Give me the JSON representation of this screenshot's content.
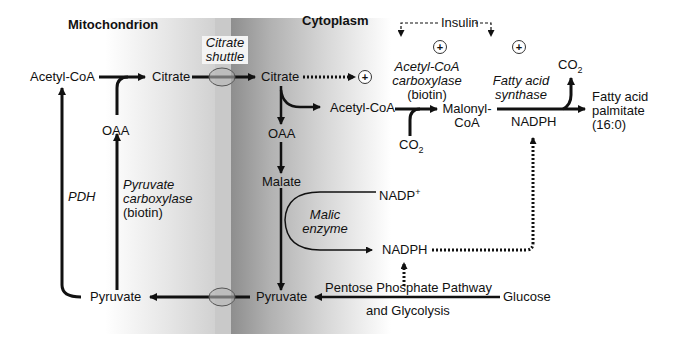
{
  "compartments": {
    "mitochondrion": "Mitochondrion",
    "cytoplasm": "Cytoplasm"
  },
  "mito": {
    "acetyl_coa": "Acetyl-CoA",
    "citrate": "Citrate",
    "oaa": "OAA",
    "pyruvate": "Pyruvate",
    "pdh": "PDH",
    "pyruvate_carboxylase": [
      "Pyruvate",
      "carboxylase"
    ],
    "pc_cofactor": "(biotin)"
  },
  "shuttle": {
    "label": [
      "Citrate",
      "shuttle"
    ]
  },
  "cyto": {
    "citrate": "Citrate",
    "oaa": "OAA",
    "malate": "Malate",
    "pyruvate": "Pyruvate",
    "acetyl_coa": "Acetyl-CoA",
    "malonyl_coa": [
      "Malonyl-",
      "CoA"
    ],
    "co2_in": "CO",
    "co2_out": "CO",
    "co2_sub": "2",
    "acc_enzyme": [
      "Acetyl-CoA",
      "carboxylase"
    ],
    "acc_cofactor": "(biotin)",
    "fas_enzyme": [
      "Fatty acid",
      "synthase"
    ],
    "nadph_fas": "NADPH",
    "product": [
      "Fatty acid",
      "palmitate",
      "(16:0)"
    ],
    "nadp_plus": "NADP",
    "nadp_plus_sup": "+",
    "nadph_malic": "NADPH",
    "malic_enzyme": [
      "Malic",
      "enzyme"
    ],
    "ppp": "Pentose Phosphate Pathway",
    "glycolysis": "and Glycolysis",
    "glucose": "Glucose"
  },
  "regulation": {
    "insulin": "Insulin",
    "activator_symbol": "+"
  },
  "colors": {
    "ink": "#111111",
    "membrane_dark": "#8e8e8e",
    "transporter_fill": "#b5b5b5",
    "transporter_stroke": "#555555"
  }
}
